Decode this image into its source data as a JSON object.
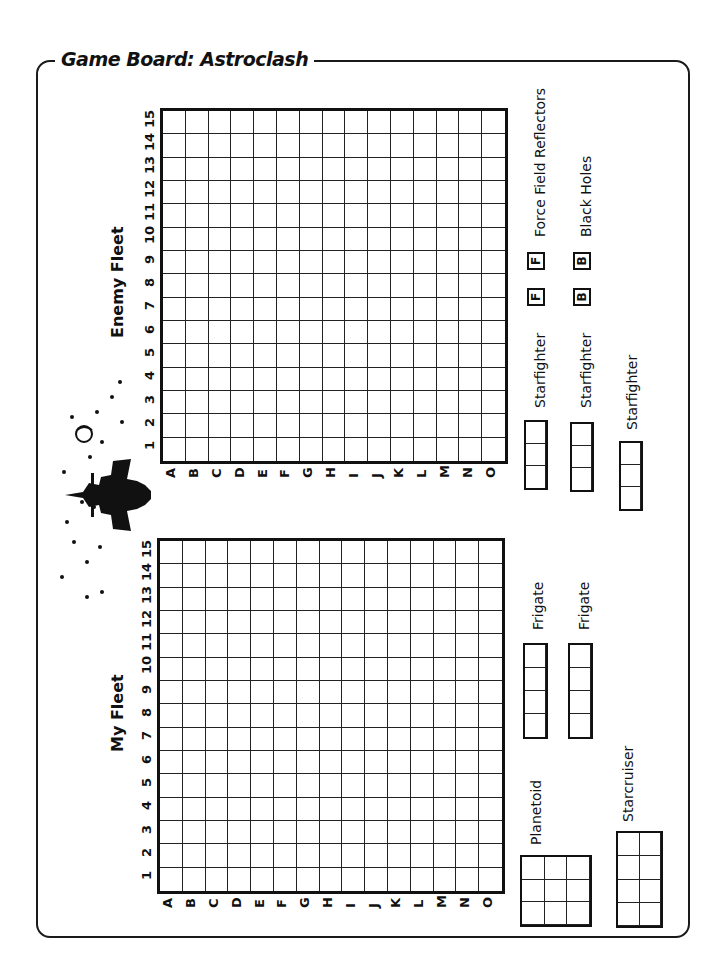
{
  "title": "Game Board: Astroclash",
  "enemy_fleet": {
    "label": "Enemy Fleet",
    "columns": [
      "1",
      "2",
      "3",
      "4",
      "5",
      "6",
      "7",
      "8",
      "9",
      "10",
      "11",
      "12",
      "13",
      "14",
      "15"
    ],
    "rows": [
      "A",
      "B",
      "C",
      "D",
      "E",
      "F",
      "G",
      "H",
      "I",
      "J",
      "K",
      "L",
      "M",
      "N",
      "O"
    ]
  },
  "my_fleet": {
    "label": "My Fleet",
    "columns": [
      "1",
      "2",
      "3",
      "4",
      "5",
      "6",
      "7",
      "8",
      "9",
      "10",
      "11",
      "12",
      "13",
      "14",
      "15"
    ],
    "rows": [
      "A",
      "B",
      "C",
      "D",
      "E",
      "F",
      "G",
      "H",
      "I",
      "J",
      "K",
      "L",
      "M",
      "N",
      "O"
    ]
  },
  "ships": {
    "starfighters": [
      {
        "label": "Starfighter",
        "cells": 3
      },
      {
        "label": "Starfighter",
        "cells": 3
      },
      {
        "label": "Starfighter",
        "cells": 3
      }
    ],
    "frigates": [
      {
        "label": "Frigate",
        "cells": 4
      },
      {
        "label": "Frigate",
        "cells": 4
      }
    ],
    "planetoid": {
      "label": "Planetoid",
      "size": "3x3"
    },
    "starcruiser": {
      "label": "Starcruiser",
      "size": "2x4"
    }
  },
  "legend": {
    "force_field": {
      "token": "F",
      "label": "Force Field Reflectors",
      "count": 2
    },
    "black_holes": {
      "token": "B",
      "label": "Black Holes",
      "count": 2
    }
  },
  "decoration": {
    "icon": "jet-fighter-icon"
  }
}
